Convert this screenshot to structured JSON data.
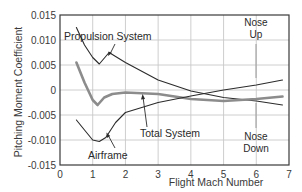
{
  "chart_data": {
    "type": "line",
    "title": "",
    "xlabel": "Flight Mach Number",
    "ylabel": "Pitching Moment Coefficient",
    "xlim": [
      0,
      7
    ],
    "ylim": [
      -0.015,
      0.015
    ],
    "x_ticks": [
      "0",
      "1",
      "2",
      "3",
      "4",
      "5",
      "6",
      "7"
    ],
    "y_ticks": [
      "0.015",
      "0.010",
      "0.005",
      "0",
      "-0.005",
      "-0.010",
      "-0.015"
    ],
    "grid": true,
    "legend": "none (inline labels)",
    "series": [
      {
        "name": "Propulsion System",
        "color": "#2b2b2b",
        "points": [
          [
            0.5,
            0.0125
          ],
          [
            0.75,
            0.009
          ],
          [
            1.0,
            0.0065
          ],
          [
            1.2,
            0.0052
          ],
          [
            1.5,
            0.0075
          ],
          [
            2.0,
            0.0055
          ],
          [
            3.0,
            0.002
          ],
          [
            4.0,
            -0.0002
          ],
          [
            5.0,
            -0.0015
          ],
          [
            6.0,
            -0.0022
          ],
          [
            6.8,
            -0.003
          ]
        ]
      },
      {
        "name": "Total System",
        "color": "#8c8c8c",
        "points": [
          [
            0.5,
            0.0055
          ],
          [
            0.75,
            0.0015
          ],
          [
            1.0,
            -0.002
          ],
          [
            1.15,
            -0.003
          ],
          [
            1.35,
            -0.0015
          ],
          [
            1.6,
            -0.0008
          ],
          [
            2.0,
            -0.0005
          ],
          [
            3.0,
            -0.0008
          ],
          [
            4.0,
            -0.0018
          ],
          [
            5.0,
            -0.0022
          ],
          [
            6.0,
            -0.0018
          ],
          [
            6.8,
            -0.0013
          ]
        ]
      },
      {
        "name": "Airframe",
        "color": "#2b2b2b",
        "points": [
          [
            0.5,
            -0.006
          ],
          [
            0.75,
            -0.008
          ],
          [
            1.0,
            -0.01
          ],
          [
            1.2,
            -0.0103
          ],
          [
            1.4,
            -0.0095
          ],
          [
            1.7,
            -0.0065
          ],
          [
            2.0,
            -0.0045
          ],
          [
            3.0,
            -0.0025
          ],
          [
            4.0,
            -0.0012
          ],
          [
            5.0,
            0.0
          ],
          [
            6.0,
            0.001
          ],
          [
            6.8,
            0.002
          ]
        ]
      }
    ],
    "annotations": [
      {
        "text": "Propulsion System",
        "x": 1.5,
        "y": 0.0104
      },
      {
        "text": "Total System",
        "x": 3.7,
        "y": -0.0085
      },
      {
        "text": "Airframe",
        "x": 1.6,
        "y": -0.013
      },
      {
        "text": "Nose Up",
        "x": 6.0,
        "y": 0.013
      },
      {
        "text": "Nose Down",
        "x": 6.0,
        "y": -0.0115
      }
    ]
  },
  "labels": {
    "ylabel": "Pitching Moment Coefficient",
    "xlabel": "Flight Mach Number",
    "propulsion": "Propulsion System",
    "total": "Total System",
    "airframe": "Airframe",
    "nose_up_1": "Nose",
    "nose_up_2": "Up",
    "nose_down_1": "Nose",
    "nose_down_2": "Down"
  }
}
